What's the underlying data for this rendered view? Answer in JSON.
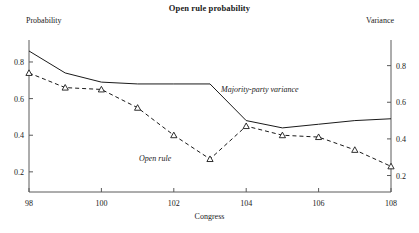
{
  "chart_data": {
    "type": "line",
    "title": "Open rule probability",
    "xlabel": "Congress",
    "ylabel": "Probability",
    "ylabel_right": "Variance",
    "x": [
      98,
      99,
      100,
      101,
      102,
      103,
      104,
      105,
      106,
      107,
      108
    ],
    "xlim": [
      98,
      108
    ],
    "xticks": [
      98,
      100,
      102,
      104,
      106,
      108
    ],
    "xticklabels": [
      "98",
      "100",
      "102",
      "104",
      "106",
      "108"
    ],
    "ylim": [
      0.09,
      0.92
    ],
    "yticks": [
      0.2,
      0.4,
      0.6,
      0.8
    ],
    "yticklabels": [
      "0.2",
      "0.4",
      "0.6",
      "0.8"
    ],
    "ylim_right": [
      0.11,
      0.94
    ],
    "yticks_right": [
      0.2,
      0.4,
      0.6,
      0.8
    ],
    "yticklabels_right": [
      "0.2",
      "0.4",
      "0.6",
      "0.8"
    ],
    "grid": false,
    "legend": "in-plot annotations",
    "series": [
      {
        "name": "Open rule",
        "axis": "left",
        "style": "dashed",
        "marker": "triangle",
        "annotation": "Open rule",
        "values": [
          0.74,
          0.66,
          0.65,
          0.55,
          0.4,
          0.27,
          0.45,
          0.4,
          0.39,
          0.32,
          0.23
        ]
      },
      {
        "name": "Majority-party variance",
        "axis": "right",
        "style": "solid",
        "marker": "none",
        "annotation": "Majority-party variance",
        "values": [
          0.88,
          0.76,
          0.71,
          0.7,
          0.7,
          0.7,
          0.5,
          0.46,
          0.48,
          0.5,
          0.51
        ]
      }
    ]
  }
}
